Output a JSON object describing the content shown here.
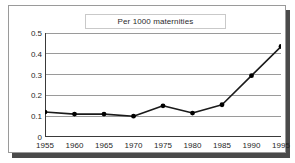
{
  "chart_data": {
    "type": "line",
    "title": "Per 1000 maternities",
    "xlabel": "",
    "ylabel": "",
    "x": [
      1955,
      1960,
      1965,
      1970,
      1975,
      1980,
      1985,
      1990,
      1995
    ],
    "xticklabels": [
      "1955",
      "1960",
      "1965",
      "1970",
      "1975",
      "1980",
      "1985",
      "1990",
      "1995"
    ],
    "values": [
      0.12,
      0.11,
      0.11,
      0.1,
      0.15,
      0.115,
      0.155,
      0.295,
      0.435
    ],
    "yticks": [
      0,
      0.1,
      0.2,
      0.3,
      0.4,
      0.5
    ],
    "yticklabels": [
      "0",
      "0.1",
      "0.2",
      "0.3",
      "0.4",
      "0.5"
    ],
    "ylim": [
      0,
      0.5
    ],
    "xlim": [
      1955,
      1995
    ],
    "grid": "horizontal",
    "legend": "none",
    "series_name": "Per 1000 maternities",
    "line_color": "#1a1a1a",
    "marker": "circle",
    "marker_color": "#000000",
    "gridline_color": "#9a9a9a",
    "axis_color": "#3a3a3a",
    "background_color": "#ffffff",
    "frame_border_color": "#9a9a9a",
    "shadow_color": "#4a4a4a"
  }
}
